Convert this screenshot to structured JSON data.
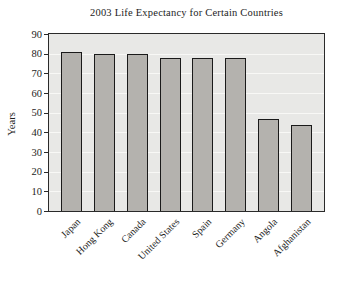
{
  "chart_data": {
    "type": "bar",
    "title": "2003 Life Expectancy for Certain Countries",
    "ylabel": "Years",
    "xlabel": "",
    "categories": [
      "Japan",
      "Hong Kong",
      "Canada",
      "United States",
      "Spain",
      "Germany",
      "Angola",
      "Afghanistan"
    ],
    "values": [
      81,
      80,
      80,
      78,
      78,
      78,
      47,
      44
    ],
    "ylim": [
      0,
      90
    ],
    "y_ticks": [
      0,
      10,
      20,
      30,
      40,
      50,
      60,
      70,
      80,
      90
    ],
    "grid": "horizontal",
    "legend": "none",
    "colors": {
      "page_bg": "#ffffff",
      "plot_bg": "#e8e8e6",
      "gridline": "#f8f8f6",
      "frame": "#2a2a2a",
      "bar_fill": "#b4b2ae",
      "bar_border": "#1a1a1a",
      "text": "#1c1c1c"
    }
  }
}
